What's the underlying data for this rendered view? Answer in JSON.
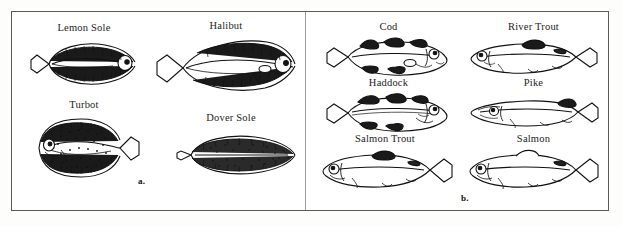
{
  "figure": {
    "background_color": "#ffffff",
    "frame_color": "#5a5a5a",
    "ink_color": "#111111",
    "label_color": "#1d1d1d"
  },
  "panels": [
    {
      "id": "a",
      "marker": "a.",
      "marker_x": 127,
      "marker_y": 176,
      "group": "flatfish",
      "fish": [
        {
          "name": "Lemon Sole",
          "icon": "lemon-sole-icon",
          "label_x": 8,
          "label_y": 22,
          "cell_w": 130,
          "art_x": 14,
          "art_y": 38,
          "art_w": 118,
          "art_h": 52,
          "orientation": "head-right",
          "shape": "oval-flat"
        },
        {
          "name": "Halibut",
          "icon": "halibut-icon",
          "label_x": 140,
          "label_y": 20,
          "cell_w": 150,
          "art_x": 142,
          "art_y": 36,
          "art_w": 148,
          "art_h": 60,
          "orientation": "head-right",
          "shape": "diamond-elongated"
        },
        {
          "name": "Turbot",
          "icon": "turbot-icon",
          "label_x": 8,
          "label_y": 99,
          "cell_w": 130,
          "art_x": 14,
          "art_y": 114,
          "art_w": 118,
          "art_h": 68,
          "orientation": "head-right",
          "shape": "broad-diamond-speckled"
        },
        {
          "name": "Dover Sole",
          "icon": "dover-sole-icon",
          "label_x": 150,
          "label_y": 112,
          "cell_w": 140,
          "art_x": 158,
          "art_y": 130,
          "art_w": 132,
          "art_h": 50,
          "orientation": "head-right",
          "shape": "narrow-oval-speckled"
        }
      ]
    },
    {
      "id": "b",
      "marker": "b.",
      "marker_x": 155,
      "marker_y": 193,
      "group": "roundfish",
      "fish": [
        {
          "name": "Cod",
          "icon": "cod-icon",
          "label_x": 10,
          "label_y": 21,
          "cell_w": 145,
          "art_x": 16,
          "art_y": 36,
          "art_w": 132,
          "art_h": 42,
          "orientation": "head-right",
          "shape": "roundfish-three-dorsal"
        },
        {
          "name": "River Trout",
          "icon": "river-trout-icon",
          "label_x": 155,
          "label_y": 21,
          "cell_w": 145,
          "art_x": 160,
          "art_y": 38,
          "art_w": 136,
          "art_h": 40,
          "orientation": "head-left",
          "shape": "trout-streamlined"
        },
        {
          "name": "Haddock",
          "icon": "haddock-icon",
          "label_x": 10,
          "label_y": 77,
          "cell_w": 145,
          "art_x": 16,
          "art_y": 92,
          "art_w": 132,
          "art_h": 42,
          "orientation": "head-right",
          "shape": "roundfish-three-dorsal"
        },
        {
          "name": "Pike",
          "icon": "pike-icon",
          "label_x": 155,
          "label_y": 77,
          "cell_w": 145,
          "art_x": 160,
          "art_y": 92,
          "art_w": 136,
          "art_h": 42,
          "orientation": "head-left",
          "shape": "pike-elongated"
        },
        {
          "name": "Salmon Trout",
          "icon": "salmon-trout-icon",
          "label_x": 4,
          "label_y": 133,
          "cell_w": 150,
          "art_x": 12,
          "art_y": 148,
          "art_w": 140,
          "art_h": 46,
          "orientation": "head-left",
          "shape": "salmonid"
        },
        {
          "name": "Salmon",
          "icon": "salmon-icon",
          "label_x": 155,
          "label_y": 133,
          "cell_w": 145,
          "art_x": 160,
          "art_y": 148,
          "art_w": 138,
          "art_h": 46,
          "orientation": "head-left",
          "shape": "salmonid"
        }
      ]
    }
  ]
}
